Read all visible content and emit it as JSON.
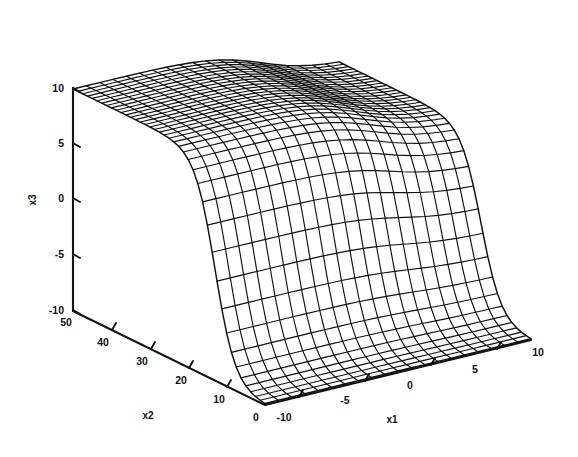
{
  "figure": {
    "type": "surface-plot",
    "title": "",
    "background_color": "#ffffff",
    "line_color": "#111111",
    "mesh_style": "wireframe"
  },
  "axes": {
    "x1": {
      "label": "x1",
      "ticks": [
        "-10",
        "-5",
        "0",
        "5",
        "10"
      ],
      "range": [
        -10,
        10
      ],
      "orientation": "lower-right-diagonal"
    },
    "x2": {
      "label": "x2",
      "ticks": [
        "50",
        "40",
        "30",
        "20",
        "10",
        "0"
      ],
      "range": [
        0,
        50
      ],
      "orientation": "lower-left-diagonal"
    },
    "x3": {
      "label": "x3",
      "ticks": [
        "10",
        "5",
        "0",
        "-5",
        "-10"
      ],
      "range": [
        -10,
        10
      ],
      "orientation": "vertical"
    }
  },
  "chart_data": {
    "type": "surface",
    "title": "",
    "xlabel": "x1",
    "ylabel": "x2",
    "zlabel": "x3",
    "xlim": [
      -10,
      10
    ],
    "ylim": [
      0,
      50
    ],
    "zlim": [
      -10,
      10
    ],
    "grid": false,
    "legend": "none",
    "mesh": {
      "n_x1": 21,
      "n_x2": 41
    },
    "x1_ticks": [
      -10,
      -5,
      0,
      5,
      10
    ],
    "x2_ticks": [
      0,
      10,
      20,
      30,
      40,
      50
    ],
    "x3_ticks": [
      -10,
      -5,
      0,
      5,
      10
    ]
  }
}
